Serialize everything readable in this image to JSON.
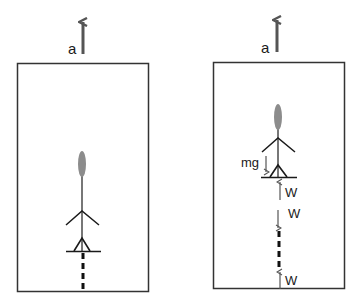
{
  "diagram": {
    "left_panel": {
      "acceleration_label": "a"
    },
    "right_panel": {
      "acceleration_label": "a",
      "gravity_label": "mg",
      "force_labels": [
        "W",
        "W",
        "W"
      ]
    }
  },
  "colors": {
    "box_stroke": "#333333",
    "arrow_gray": "#555555",
    "head_fill": "#8c8c8c",
    "body_gray": "#777777",
    "limb_black": "#1a1a1a",
    "force_arrow": "#555555"
  }
}
